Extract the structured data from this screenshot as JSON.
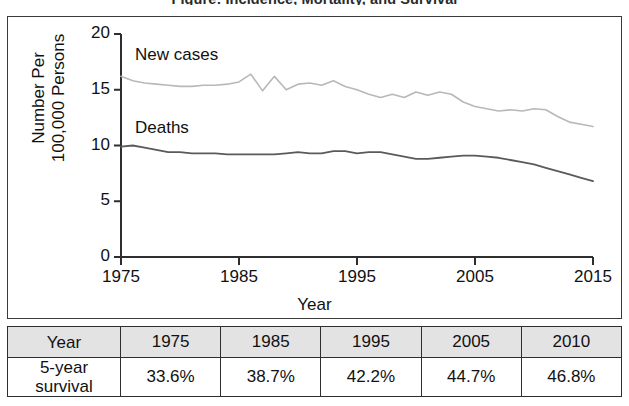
{
  "figure": {
    "title": "Figure: Incidence, Mortality, and Survival"
  },
  "chart": {
    "ylabel_line1": "Number Per",
    "ylabel_line2": "100,000 Persons",
    "xlabel": "Year",
    "y_ticks": [
      "0",
      "5",
      "10",
      "15",
      "20"
    ],
    "x_ticks": [
      "1975",
      "1985",
      "1995",
      "2005",
      "2015"
    ],
    "series_labels": {
      "new_cases": "New cases",
      "deaths": "Deaths"
    },
    "colors": {
      "new_cases": "#b8b8b8",
      "deaths": "#5a5a5a",
      "axis": "#2e2e2e",
      "frame": "#3a3a3a",
      "table_header_bg": "#e3e3e3"
    }
  },
  "table": {
    "header": [
      "Year",
      "1975",
      "1985",
      "1995",
      "2005",
      "2010"
    ],
    "rows": [
      {
        "label_line1": "5-year",
        "label_line2": "survival",
        "values": [
          "33.6%",
          "38.7%",
          "42.2%",
          "44.7%",
          "46.8%"
        ]
      }
    ]
  },
  "chart_data": {
    "type": "line",
    "xlabel": "Year",
    "ylabel": "Number Per 100,000 Persons",
    "xlim": [
      1975,
      2015
    ],
    "ylim": [
      0,
      20
    ],
    "yticks": [
      0,
      5,
      10,
      15,
      20
    ],
    "xticks": [
      1975,
      1985,
      1995,
      2005,
      2015
    ],
    "grid": false,
    "legend": "inline-labels",
    "x": [
      1975,
      1976,
      1977,
      1978,
      1979,
      1980,
      1981,
      1982,
      1983,
      1984,
      1985,
      1986,
      1987,
      1988,
      1989,
      1990,
      1991,
      1992,
      1993,
      1994,
      1995,
      1996,
      1997,
      1998,
      1999,
      2000,
      2001,
      2002,
      2003,
      2004,
      2005,
      2006,
      2007,
      2008,
      2009,
      2010,
      2011,
      2012,
      2013,
      2014,
      2015
    ],
    "series": [
      {
        "name": "New cases",
        "color": "#b8b8b8",
        "values": [
          16.2,
          15.8,
          15.6,
          15.5,
          15.4,
          15.3,
          15.3,
          15.4,
          15.4,
          15.5,
          15.7,
          16.4,
          14.9,
          16.2,
          15.0,
          15.5,
          15.6,
          15.4,
          15.8,
          15.3,
          15.0,
          14.6,
          14.3,
          14.6,
          14.3,
          14.8,
          14.5,
          14.8,
          14.6,
          13.9,
          13.5,
          13.3,
          13.1,
          13.2,
          13.1,
          13.3,
          13.2,
          12.6,
          12.1,
          11.9,
          11.7
        ]
      },
      {
        "name": "Deaths",
        "color": "#5a5a5a",
        "values": [
          9.9,
          10.0,
          9.8,
          9.6,
          9.4,
          9.4,
          9.3,
          9.3,
          9.3,
          9.2,
          9.2,
          9.2,
          9.2,
          9.2,
          9.3,
          9.4,
          9.3,
          9.3,
          9.5,
          9.5,
          9.3,
          9.4,
          9.4,
          9.2,
          9.0,
          8.8,
          8.8,
          8.9,
          9.0,
          9.1,
          9.1,
          9.0,
          8.9,
          8.7,
          8.5,
          8.3,
          8.0,
          7.7,
          7.4,
          7.1,
          6.8
        ]
      }
    ],
    "table": {
      "header": [
        "Year",
        "1975",
        "1985",
        "1995",
        "2005",
        "2010"
      ],
      "rows": [
        [
          "5-year survival",
          "33.6%",
          "38.7%",
          "42.2%",
          "44.7%",
          "46.8%"
        ]
      ]
    }
  }
}
